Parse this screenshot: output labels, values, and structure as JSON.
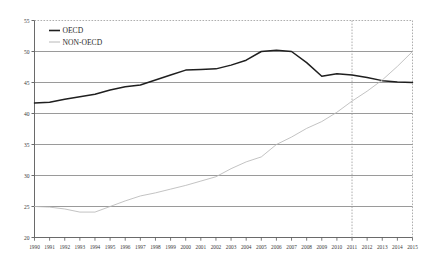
{
  "chart_data": {
    "type": "line",
    "title": "",
    "subtitle": "",
    "xlabel": "",
    "ylabel": "",
    "xlim": [
      1990,
      2015
    ],
    "ylim": [
      20,
      55
    ],
    "y_ticks": [
      20,
      25,
      30,
      35,
      40,
      45,
      50,
      55
    ],
    "grid": true,
    "legend_position": "top-left",
    "annotations": [
      {
        "name": "forecast-divider",
        "type": "vertical-dashed-line",
        "x": 2011
      }
    ],
    "x": [
      1990,
      1991,
      1992,
      1993,
      1994,
      1995,
      1996,
      1997,
      1998,
      1999,
      2000,
      2001,
      2002,
      2003,
      2004,
      2005,
      2006,
      2007,
      2008,
      2009,
      2010,
      2011,
      2012,
      2013,
      2014,
      2015
    ],
    "categories": [
      "1990",
      "1991",
      "1992",
      "1993",
      "1994",
      "1995",
      "1996",
      "1997",
      "1998",
      "1999",
      "2000",
      "2001",
      "2002",
      "2003",
      "2004",
      "2005",
      "2006",
      "2007",
      "2008",
      "2009",
      "2010",
      "2011",
      "2012",
      "2013",
      "2014",
      "2015"
    ],
    "series": [
      {
        "name": "OECD",
        "color": "#1f1f1f",
        "values": [
          41.7,
          41.8,
          42.3,
          42.7,
          43.1,
          43.8,
          44.3,
          44.6,
          45.4,
          46.2,
          47.0,
          47.1,
          47.2,
          47.8,
          48.6,
          50.0,
          50.2,
          50.0,
          48.2,
          46.0,
          46.4,
          46.2,
          45.8,
          45.3,
          45.1,
          45.0
        ]
      },
      {
        "name": "NON-OECD",
        "color": "#b8b8b8",
        "values": [
          25.0,
          24.9,
          24.6,
          24.1,
          24.1,
          25.0,
          25.9,
          26.7,
          27.2,
          27.8,
          28.4,
          29.1,
          29.8,
          31.1,
          32.2,
          33.0,
          35.0,
          36.2,
          37.6,
          38.7,
          40.2,
          42.0,
          43.6,
          45.4,
          47.6,
          50.0
        ]
      }
    ]
  },
  "legend": {
    "items": [
      {
        "label": "OECD",
        "color": "#1f1f1f"
      },
      {
        "label": "NON-OECD",
        "color": "#b8b8b8"
      }
    ]
  },
  "axes": {
    "y_tick_labels": [
      "55",
      "50",
      "45",
      "40",
      "35",
      "30",
      "25",
      "20"
    ],
    "x_tick_labels": [
      "1990",
      "1991",
      "1992",
      "1993",
      "1994",
      "1995",
      "1996",
      "1997",
      "1998",
      "1999",
      "2000",
      "2001",
      "2002",
      "2003",
      "2004",
      "2005",
      "2006",
      "2007",
      "2008",
      "2009",
      "2010",
      "2011",
      "2012",
      "2013",
      "2014",
      "2015"
    ]
  },
  "style": {
    "gridline_color": "#808080",
    "axis_color": "#595959",
    "dashed_border_color": "#9a9a9a",
    "background": "#ffffff"
  }
}
